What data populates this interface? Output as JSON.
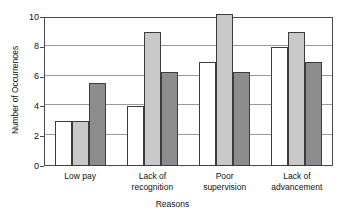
{
  "chart_data": {
    "type": "bar",
    "title": "",
    "subtitle": "",
    "xlabel": "Reasons",
    "ylabel": "Number of Occurrences",
    "categories": [
      "Low pay",
      "Lack of recognition",
      "Poor supervision",
      "Lack of advancement"
    ],
    "category_lines": [
      [
        "Low pay"
      ],
      [
        "Lack of",
        "recognition"
      ],
      [
        "Poor",
        "supervision"
      ],
      [
        "Lack of",
        "advancement"
      ]
    ],
    "series": [
      {
        "name": "series-1",
        "color": "#ffffff",
        "values": [
          3,
          4,
          7,
          8
        ]
      },
      {
        "name": "series-2",
        "color": "#c9c9c9",
        "values": [
          3,
          9,
          10.2,
          9
        ]
      },
      {
        "name": "series-3",
        "color": "#8d8d8d",
        "values": [
          5.6,
          6.3,
          6.3,
          7
        ]
      }
    ],
    "ylim": [
      0,
      10
    ],
    "yticks": [
      0,
      2,
      4,
      6,
      8,
      10
    ],
    "ytick_labels": [
      "0",
      "2",
      "4",
      "6",
      "8",
      "10"
    ],
    "grid": true,
    "grid_axis": "y",
    "legend": false,
    "legend_position": "none",
    "bar_outline_color": "#3c3c3c",
    "axis_color": "#4a4a4a",
    "gridline_color": "#9a9a9a",
    "background": "#ffffff"
  }
}
